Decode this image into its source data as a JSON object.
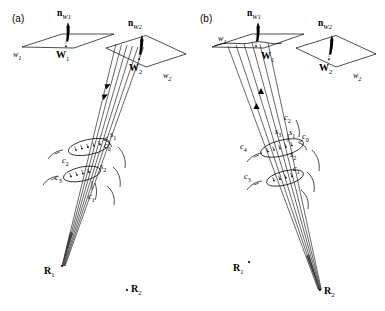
{
  "figure": {
    "background_color": "#ffffff",
    "stroke_color": "#000000",
    "panels": [
      {
        "tag": "(a)",
        "description": "Ray bundle converging at R1",
        "planes": [
          {
            "name": "w1",
            "label_plane": "w",
            "label_plane_sub": "1",
            "label_point": "W",
            "label_point_sub": "1",
            "normal_label": "n",
            "normal_sub": "W1"
          },
          {
            "name": "w2",
            "label_plane": "w",
            "label_plane_sub": "2",
            "label_point": "W",
            "label_point_sub": "2",
            "normal_label": "n",
            "normal_sub": "W2"
          }
        ],
        "receivers": [
          {
            "label": "R",
            "sub": "1",
            "state": "ray-convergence-point"
          },
          {
            "label": "R",
            "sub": "2",
            "state": "isolated-dot"
          }
        ],
        "scatter_labels": [
          "s1",
          "s2"
        ],
        "curve_labels": [
          "c0",
          "c1",
          "c2",
          "c3"
        ],
        "ray_count": 6,
        "ray_direction": "downward"
      },
      {
        "tag": "(b)",
        "description": "Ray bundle converging at R2",
        "planes": [
          {
            "name": "w1",
            "label_plane": "w",
            "label_plane_sub": "1",
            "label_point": "W",
            "label_point_sub": "1",
            "normal_label": "n",
            "normal_sub": "W1"
          },
          {
            "name": "w2",
            "label_plane": "w",
            "label_plane_sub": "2",
            "label_point": "W",
            "label_point_sub": "2",
            "normal_label": "n",
            "normal_sub": "W2"
          }
        ],
        "receivers": [
          {
            "label": "R",
            "sub": "1",
            "state": "isolated-dot"
          },
          {
            "label": "R",
            "sub": "2",
            "state": "ray-convergence-point"
          }
        ],
        "scatter_labels": [
          "s1",
          "s2",
          "s3"
        ],
        "curve_labels": [
          "c0",
          "c1",
          "c2",
          "c3",
          "c4"
        ],
        "ray_count": 6,
        "ray_direction": "upward"
      }
    ],
    "labels": {
      "panel_a_tag": "(a)",
      "panel_b_tag": "(b)",
      "n": "n",
      "W": "W",
      "w": "w",
      "R": "R",
      "s": "s",
      "c": "c",
      "sub_1": "1",
      "sub_2": "2",
      "sub_3": "3",
      "sub_4": "4",
      "sub_0": "0",
      "sub_W1": "W1",
      "sub_W2": "W2"
    }
  }
}
